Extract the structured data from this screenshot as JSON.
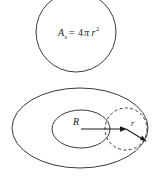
{
  "figure": {
    "background_color": "#ffffff",
    "stroke_color": "#3a3a3a",
    "text_color": "#1a1a1a",
    "width": 157,
    "height": 176
  },
  "sphere": {
    "shape": "circle",
    "center_x": 76,
    "center_y": 32,
    "radius": 40,
    "formula": {
      "variable": "A",
      "subscript": "s",
      "equals": "=",
      "coefficient": "4",
      "pi": "π",
      "radius_symbol": "r",
      "exponent": "2",
      "full": "Aₛ = 4πr²"
    }
  },
  "torus": {
    "shape": "torus",
    "outer_ellipse": {
      "center_x": 80,
      "center_y": 128,
      "rx": 68,
      "ry": 40
    },
    "inner_ellipse": {
      "center_x": 81,
      "center_y": 129,
      "rx": 29,
      "ry": 19
    },
    "tube_circle": {
      "center_x": 126,
      "center_y": 129,
      "radius": 21,
      "style": "dashed"
    },
    "labels": {
      "major_radius": "R",
      "minor_radius": "r"
    },
    "major_radius_arrow": {
      "from_x": 81,
      "from_y": 129,
      "to_x": 126,
      "to_y": 129
    },
    "minor_radius_arrow": {
      "from_x": 126,
      "from_y": 129,
      "to_x": 146,
      "to_y": 141
    }
  }
}
